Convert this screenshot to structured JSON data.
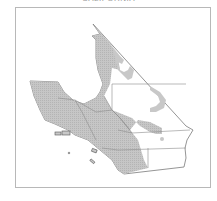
{
  "map": {
    "title": "CALIFORNIA",
    "colors": {
      "background": "#ffffff",
      "frame": "#b8b8b8",
      "land": "#ffffff",
      "shaded": "#c8c8c8",
      "border": "#7a7a7a",
      "county_line": "#8c8c8c"
    },
    "layers": [
      "region-outline",
      "shaded-distribution",
      "county-boundaries",
      "islands"
    ]
  }
}
